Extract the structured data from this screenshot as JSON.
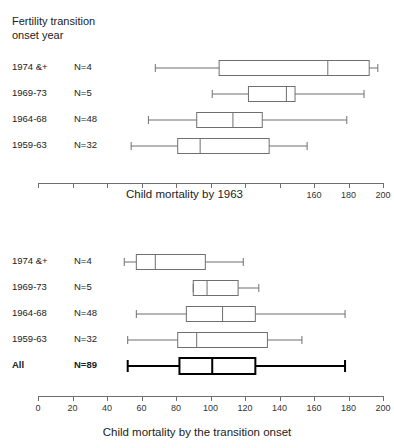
{
  "figure": {
    "heading": "Fertility transition\nonset year"
  },
  "chart_data": [
    {
      "type": "box",
      "title": "",
      "xlabel": "Child mortality by 1963",
      "ylabel": "Fertility transition onset year",
      "xlim": [
        0,
        200
      ],
      "xticks": [
        0,
        20,
        40,
        60,
        80,
        100,
        120,
        140,
        160,
        180,
        200
      ],
      "visible_xtick_labels": [
        "0",
        "20",
        "40",
        "160",
        "180",
        "200"
      ],
      "grid": false,
      "orientation": "horizontal",
      "categories": [
        "1974 &+",
        "1969-73",
        "1964-68",
        "1959-63"
      ],
      "counts": [
        "N=4",
        "N=5",
        "N=48",
        "N=32"
      ],
      "boxes": [
        {
          "category": "1974 &+",
          "count": "N=4",
          "min": 68,
          "q1": 105,
          "median": 168,
          "q3": 192,
          "max": 197,
          "emphasis": false
        },
        {
          "category": "1969-73",
          "count": "N=5",
          "min": 101,
          "q1": 122,
          "median": 144,
          "q3": 149,
          "max": 189,
          "emphasis": false
        },
        {
          "category": "1964-68",
          "count": "N=48",
          "min": 64,
          "q1": 92,
          "median": 113,
          "q3": 130,
          "max": 179,
          "emphasis": false
        },
        {
          "category": "1959-63",
          "count": "N=32",
          "min": 54,
          "q1": 81,
          "median": 94,
          "q3": 134,
          "max": 156,
          "emphasis": false
        }
      ]
    },
    {
      "type": "box",
      "title": "",
      "xlabel": "Child mortality by the transition onset",
      "ylabel": "Fertility transition onset year",
      "xlim": [
        0,
        200
      ],
      "xticks": [
        0,
        20,
        40,
        60,
        80,
        100,
        120,
        140,
        160,
        180,
        200
      ],
      "visible_xtick_labels": [
        "0",
        "20",
        "40",
        "60",
        "80",
        "100",
        "120",
        "140",
        "160",
        "180",
        "200"
      ],
      "grid": false,
      "orientation": "horizontal",
      "categories": [
        "1974 &+",
        "1969-73",
        "1964-68",
        "1959-63",
        "All"
      ],
      "counts": [
        "N=4",
        "N=5",
        "N=48",
        "N=32",
        "N=89"
      ],
      "boxes": [
        {
          "category": "1974 &+",
          "count": "N=4",
          "min": 50,
          "q1": 57,
          "median": 68,
          "q3": 97,
          "max": 119,
          "emphasis": false
        },
        {
          "category": "1969-73",
          "count": "N=5",
          "min": 90,
          "q1": 90,
          "median": 98,
          "q3": 116,
          "max": 128,
          "emphasis": false
        },
        {
          "category": "1964-68",
          "count": "N=48",
          "min": 57,
          "q1": 86,
          "median": 107,
          "q3": 126,
          "max": 178,
          "emphasis": false
        },
        {
          "category": "1959-63",
          "count": "N=32",
          "min": 52,
          "q1": 81,
          "median": 92,
          "q3": 133,
          "max": 153,
          "emphasis": false
        },
        {
          "category": "All",
          "count": "N=89",
          "min": 52,
          "q1": 82,
          "median": 101,
          "q3": 126,
          "max": 178,
          "emphasis": true
        }
      ]
    }
  ],
  "style": {
    "line_color": "#6f6f6f",
    "emphasis_color": "#000000",
    "text_color": "#222222",
    "background": "#ffffff"
  }
}
